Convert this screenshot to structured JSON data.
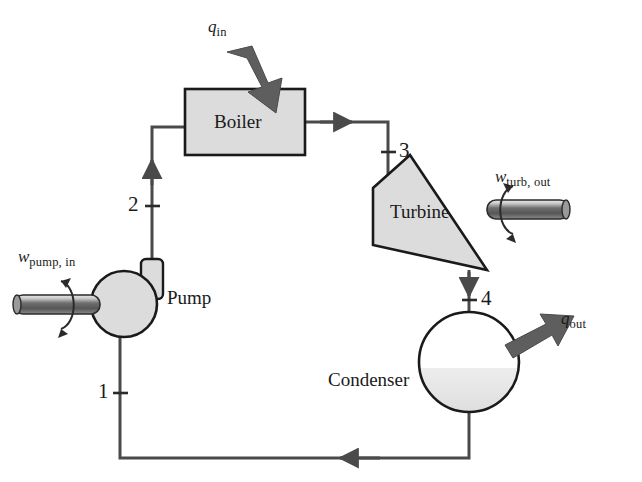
{
  "diagram": {
    "components": [
      {
        "id": "boiler",
        "label": "Boiler"
      },
      {
        "id": "turbine",
        "label": "Turbine"
      },
      {
        "id": "condenser",
        "label": "Condenser"
      },
      {
        "id": "pump",
        "label": "Pump"
      }
    ],
    "state_points": [
      {
        "id": "1",
        "label": "1"
      },
      {
        "id": "2",
        "label": "2"
      },
      {
        "id": "3",
        "label": "3"
      },
      {
        "id": "4",
        "label": "4"
      }
    ],
    "energy_flows": [
      {
        "id": "q-in",
        "symbol": "q",
        "subscript": "in",
        "direction": "into-boiler"
      },
      {
        "id": "q-out",
        "symbol": "q",
        "subscript": "out",
        "direction": "out-of-condenser"
      },
      {
        "id": "w-turb-out",
        "symbol": "w",
        "subscript": "turb, out",
        "direction": "out-of-turbine"
      },
      {
        "id": "w-pump-in",
        "symbol": "w",
        "subscript": "pump, in",
        "direction": "into-pump"
      }
    ],
    "colors": {
      "line": "#4a4a4a",
      "outline": "#1a1a1a",
      "component_fill": "#dcdcdc",
      "arrow_block": "#5e5e5e",
      "liquid_fill": "#e0e0e0",
      "background": "#ffffff"
    }
  }
}
